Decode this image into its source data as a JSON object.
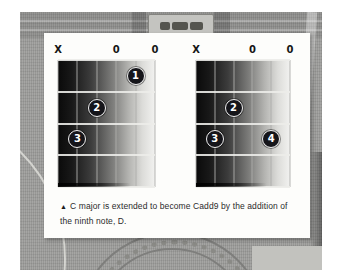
{
  "colors": {
    "finger_dot": "#15151a",
    "finger_ring": "#f2f2f2",
    "finger_number": "#ffffff",
    "grid_dark": "#0a0a0a",
    "grid_light": "#f2f2f0",
    "card_bg": "#fdfdfb",
    "photo_gray": "#9e9e9c"
  },
  "diagrams": [
    {
      "chord": "C major",
      "strings": 6,
      "frets": 4,
      "open_marks": [
        {
          "string": 0,
          "label": "X"
        },
        {
          "string": 3,
          "label": "0"
        },
        {
          "string": 5,
          "label": "0"
        }
      ],
      "fingers": [
        {
          "number": "1",
          "string": 4,
          "fret": 1
        },
        {
          "number": "2",
          "string": 2,
          "fret": 2
        },
        {
          "number": "3",
          "string": 1,
          "fret": 3
        }
      ]
    },
    {
      "chord": "Cadd9",
      "strings": 6,
      "frets": 4,
      "open_marks": [
        {
          "string": 0,
          "label": "X"
        },
        {
          "string": 3,
          "label": "0"
        },
        {
          "string": 5,
          "label": "0"
        }
      ],
      "fingers": [
        {
          "number": "2",
          "string": 2,
          "fret": 2
        },
        {
          "number": "3",
          "string": 1,
          "fret": 3
        },
        {
          "number": "4",
          "string": 4,
          "fret": 3
        }
      ]
    }
  ],
  "caption": {
    "marker": "▲",
    "line1": "C major is extended to become Cadd9 by the addition of",
    "line2": "the ninth note, D."
  }
}
